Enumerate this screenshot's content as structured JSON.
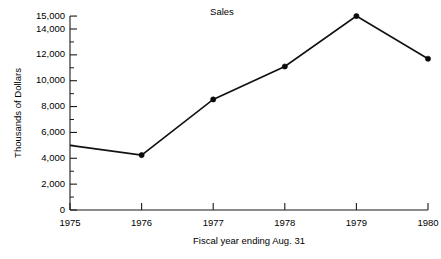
{
  "chart_data": {
    "type": "line",
    "title": "Sales",
    "xlabel": "Fiscal year ending Aug. 31",
    "ylabel": "Thousands of Dollars",
    "categories": [
      "1975",
      "1976",
      "1977",
      "1978",
      "1979",
      "1980"
    ],
    "x": [
      1975,
      1976,
      1977,
      1978,
      1979,
      1980
    ],
    "values": [
      5000,
      4250,
      8550,
      11100,
      15000,
      11700
    ],
    "series": [
      {
        "name": "Sales",
        "values": [
          5000,
          4250,
          8550,
          11100,
          15000,
          11700
        ]
      }
    ],
    "ylim": [
      0,
      15000
    ],
    "xlim": [
      1975,
      1980
    ],
    "y_tick_labels": [
      "0",
      "2,000",
      "4,000",
      "6,000",
      "8,000",
      "10,000",
      "12,000",
      "14,000",
      "15,000"
    ],
    "y_tick_values": [
      0,
      2000,
      4000,
      6000,
      8000,
      10000,
      12000,
      14000,
      15000
    ],
    "y_minor_tick_values": [
      1000,
      3000,
      5000,
      7000,
      9000,
      11000,
      13000
    ],
    "x_tick_labels": [
      "1975",
      "1976",
      "1977",
      "1978",
      "1979",
      "1980"
    ],
    "grid": false,
    "legend": "none",
    "marker": "filled-circle",
    "line_color": "#111111",
    "marker_color": "#0a0a0a",
    "axis_color": "#1a1a1a",
    "background": "#ffffff"
  },
  "labels": {
    "title": "Sales",
    "x_axis_title": "Fiscal year ending Aug. 31",
    "y_axis_title": "Thousands of Dollars"
  }
}
